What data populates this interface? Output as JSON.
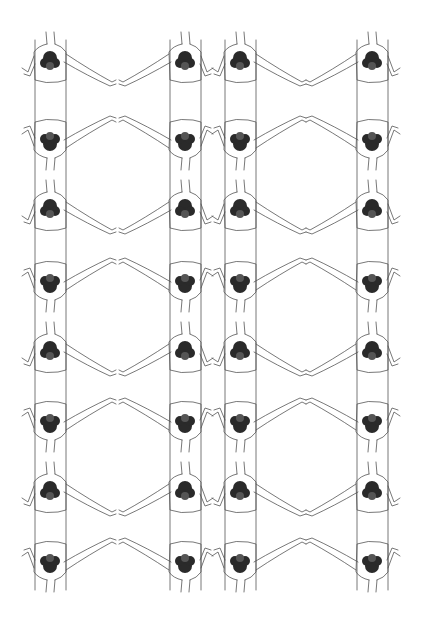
{
  "artwork": {
    "title": "",
    "description": "Repeating line-drawing pattern of figures holding hands in a chain, each with a dark floral/lace emblem on the chest; alternating rows are vertically mirrored forming oval loops",
    "columns": 4,
    "rows": 8,
    "row_orientation": [
      "upright",
      "flipped",
      "upright",
      "flipped",
      "upright",
      "flipped",
      "upright",
      "flipped"
    ],
    "colors": {
      "background": "#ffffff",
      "line": "#555555",
      "emblem": "#2a2a2a"
    }
  }
}
